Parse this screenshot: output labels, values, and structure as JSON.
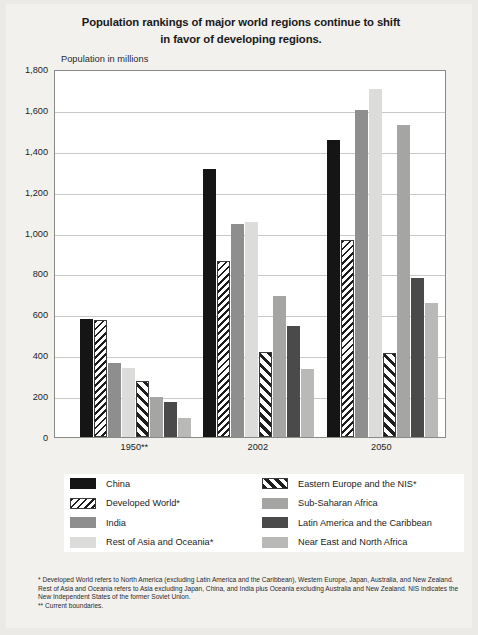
{
  "title": {
    "line1": "Population rankings of major world regions continue to shift",
    "line2": "in favor of developing regions."
  },
  "axis_title": "Population in millions",
  "legend": [
    {
      "key": "china",
      "label": "China",
      "color": "#151515",
      "pattern": "solid"
    },
    {
      "key": "ee",
      "label": "Eastern Europe and the NIS*",
      "color": "#1e1e1e",
      "pattern": "diagonal-hatch"
    },
    {
      "key": "dev",
      "label": "Developed World*",
      "color": "#1b1b1b",
      "pattern": "fine-hatch"
    },
    {
      "key": "ssa",
      "label": "Sub-Saharan Africa",
      "color": "#a5a5a3",
      "pattern": "solid"
    },
    {
      "key": "india",
      "label": "India",
      "color": "#8e8e8e",
      "pattern": "solid"
    },
    {
      "key": "latam",
      "label": "Latin America and the Caribbean",
      "color": "#4a4a4a",
      "pattern": "solid"
    },
    {
      "key": "restasia",
      "label": "Rest of Asia and Oceania*",
      "color": "#dcdcda",
      "pattern": "solid"
    },
    {
      "key": "nena",
      "label": "Near East and North Africa",
      "color": "#b9b9b7",
      "pattern": "solid"
    }
  ],
  "footnotes": {
    "note1": "* Developed World refers to North America (excluding Latin America and the Caribbean), Western Europe, Japan, Australia, and New Zealand.  Rest of Asia and Oceania refers to Asia excluding Japan, China, and India plus Oceania excluding Australia and New Zealand.  NIS indicates the New Independent States of the former Soviet Union.",
    "note2": "** Current boundaries."
  },
  "chart_data": {
    "type": "bar",
    "title": "Population rankings of major world regions continue to shift in favor of developing regions.",
    "xlabel": "",
    "ylabel": "Population in millions",
    "ylim": [
      0,
      1800
    ],
    "yticks": [
      "0",
      "200",
      "400",
      "600",
      "800",
      "1,000",
      "1,200",
      "1,400",
      "1,600",
      "1,800"
    ],
    "grid": true,
    "legend_position": "bottom",
    "categories": [
      "1950**",
      "2002",
      "2050"
    ],
    "series": [
      {
        "name": "China",
        "values": [
          575,
          1310,
          1455
        ]
      },
      {
        "name": "Developed World*",
        "values": [
          573,
          860,
          965
        ]
      },
      {
        "name": "India",
        "values": [
          362,
          1040,
          1600
        ]
      },
      {
        "name": "Rest of Asia and Oceania*",
        "values": [
          340,
          1050,
          1700
        ]
      },
      {
        "name": "Eastern Europe and the NIS*",
        "values": [
          275,
          415,
          410
        ]
      },
      {
        "name": "Sub-Saharan Africa",
        "values": [
          198,
          690,
          1525
        ]
      },
      {
        "name": "Latin America and the Caribbean",
        "values": [
          170,
          545,
          780
        ]
      },
      {
        "name": "Near East and North Africa",
        "values": [
          95,
          335,
          655
        ]
      }
    ]
  }
}
